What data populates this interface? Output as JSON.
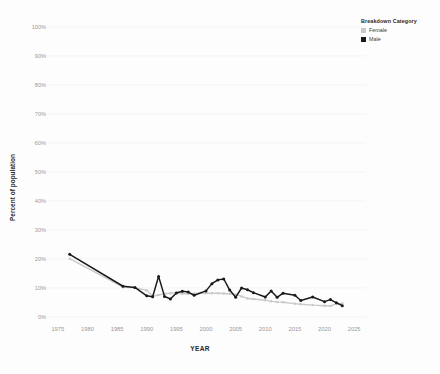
{
  "chart_data": {
    "type": "line",
    "title": "",
    "xlabel": "YEAR",
    "ylabel": "Percent of population",
    "legend_title": "Breakdown Category",
    "legend_position": "top-right",
    "grid": true,
    "xlim": [
      1973,
      2027
    ],
    "ylim": [
      0,
      100
    ],
    "xticks": [
      1975,
      1980,
      1985,
      1990,
      1995,
      2000,
      2005,
      2010,
      2015,
      2020,
      2025
    ],
    "xtick_labels": [
      "1975",
      "1980",
      "1985",
      "1990",
      "1995",
      "2000",
      "2005",
      "2010",
      "2015",
      "2020",
      "2025"
    ],
    "yticks": [
      0,
      10,
      20,
      30,
      40,
      50,
      60,
      70,
      80,
      90,
      100
    ],
    "ytick_labels": [
      "0%",
      "10%",
      "20%",
      "30%",
      "40%",
      "50%",
      "60%",
      "70%",
      "80%",
      "90%",
      "100%"
    ],
    "series": [
      {
        "name": "Female",
        "color": "#c9c9c9",
        "marker": "circle",
        "x": [
          1977,
          1986,
          1988,
          1990,
          1991,
          1992,
          1993,
          1994,
          1995,
          1996,
          1997,
          1998,
          2000,
          2001,
          2002,
          2003,
          2004,
          2005,
          2006,
          2007,
          2008,
          2010,
          2011,
          2012,
          2013,
          2015,
          2016,
          2018,
          2020,
          2021,
          2022,
          2023
        ],
        "values": [
          20.1,
          10.3,
          10.1,
          9.2,
          7.2,
          7.6,
          8.0,
          8.2,
          8.4,
          8.0,
          8.0,
          8.1,
          8.2,
          8.2,
          8.2,
          8.1,
          8.0,
          7.8,
          7.1,
          6.4,
          6.2,
          5.8,
          5.4,
          5.2,
          5.1,
          4.6,
          4.4,
          4.1,
          3.9,
          3.8,
          4.5,
          4.7
        ]
      },
      {
        "name": "Male",
        "color": "#1a1a1a",
        "marker": "circle",
        "x": [
          1977,
          1986,
          1988,
          1990,
          1991,
          1992,
          1993,
          1994,
          1995,
          1996,
          1997,
          1998,
          2000,
          2001,
          2002,
          2003,
          2004,
          2005,
          2006,
          2007,
          2008,
          2010,
          2011,
          2012,
          2013,
          2015,
          2016,
          2018,
          2020,
          2021,
          2022,
          2023
        ],
        "values": [
          21.6,
          10.6,
          10.2,
          7.3,
          7.0,
          14.0,
          7.1,
          6.2,
          8.3,
          8.9,
          8.6,
          7.5,
          9.0,
          11.5,
          12.8,
          13.1,
          9.3,
          6.8,
          10.0,
          9.4,
          8.4,
          6.9,
          9.0,
          6.8,
          8.2,
          7.5,
          5.7,
          6.9,
          5.3,
          6.0,
          4.9,
          3.9
        ]
      }
    ]
  }
}
